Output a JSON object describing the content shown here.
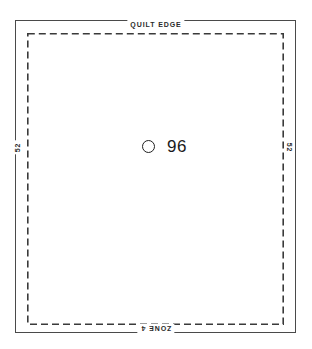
{
  "diagram": {
    "background_color": "#ffffff",
    "outline": {
      "name": "quilt-outline",
      "stroke_color": "#4a4a4a",
      "stroke_width": 1
    },
    "zone_boundary": {
      "name": "zone-boundary",
      "stroke_color": "#3a3a3a",
      "stroke_width": 1.6,
      "dash_length": 7,
      "dash_gap": 4,
      "style": "dashed"
    },
    "labels": {
      "top": "QUILT EDGE",
      "bottom": "ZONE 4",
      "left": "52",
      "right": "52"
    },
    "marker": {
      "icon": "circle-outline-icon",
      "value": "96",
      "color": "#1a1a1a"
    }
  }
}
